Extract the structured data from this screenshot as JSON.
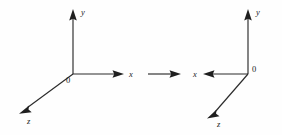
{
  "figure": {
    "background_color": "#fefefe",
    "stroke_color": "#2b2b2b",
    "label_color": "#222222",
    "width": 282,
    "height": 135
  },
  "left_diagram": {
    "name": "coordinate-system-left",
    "origin_label": "0",
    "origin": {
      "x": 73,
      "y": 74
    },
    "axes": [
      {
        "id": "y",
        "label": "y",
        "direction": "up",
        "from": {
          "x": 73,
          "y": 74
        },
        "to": {
          "x": 73,
          "y": 13
        },
        "label_pos": {
          "x": 81,
          "y": 15
        }
      },
      {
        "id": "x",
        "label": "x",
        "direction": "right",
        "from": {
          "x": 73,
          "y": 74
        },
        "to": {
          "x": 120,
          "y": 74
        },
        "label_pos": {
          "x": 129,
          "y": 77
        }
      },
      {
        "id": "z",
        "label": "z",
        "direction": "down-left",
        "from": {
          "x": 73,
          "y": 74
        },
        "to": {
          "x": 23,
          "y": 111
        },
        "label_pos": {
          "x": 27,
          "y": 124
        }
      }
    ]
  },
  "transform_arrow": {
    "name": "transform-arrow",
    "from": {
      "x": 148,
      "y": 74
    },
    "to": {
      "x": 180,
      "y": 74
    },
    "direction": "right",
    "label": ""
  },
  "right_diagram": {
    "name": "coordinate-system-right",
    "origin_label": "0",
    "origin": {
      "x": 248,
      "y": 74
    },
    "axes": [
      {
        "id": "y",
        "label": "y",
        "direction": "up",
        "from": {
          "x": 248,
          "y": 74
        },
        "to": {
          "x": 248,
          "y": 13
        },
        "label_pos": {
          "x": 256,
          "y": 15
        }
      },
      {
        "id": "x",
        "label": "x",
        "direction": "left",
        "from": {
          "x": 248,
          "y": 74
        },
        "to": {
          "x": 207,
          "y": 74
        },
        "label_pos": {
          "x": 194,
          "y": 77
        }
      },
      {
        "id": "z",
        "label": "z",
        "direction": "down-left",
        "from": {
          "x": 248,
          "y": 74
        },
        "to": {
          "x": 211,
          "y": 116
        },
        "label_pos": {
          "x": 217,
          "y": 127
        }
      }
    ],
    "origin_label_pos": {
      "x": 252,
      "y": 72
    }
  },
  "left_origin_label_pos": {
    "x": 66,
    "y": 83
  }
}
